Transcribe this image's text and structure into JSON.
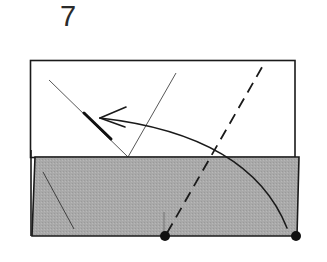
{
  "step": {
    "number": "7"
  },
  "diagram": {
    "colors": {
      "paper_front": "#ffffff",
      "paper_back": "#a9a9a9",
      "line": "#1a1a1a",
      "thin_line": "#444444"
    },
    "elements": [
      "white-paper-layer",
      "gray-paper-layer",
      "valley-fold-dashed-line",
      "fold-arrow",
      "reference-dots",
      "existing-crease-lines"
    ]
  }
}
